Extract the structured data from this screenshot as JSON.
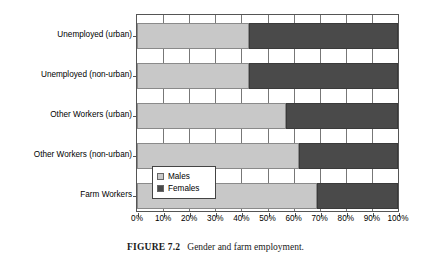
{
  "caption": {
    "label": "FIGURE 7.2",
    "text": "Gender and farm employment."
  },
  "legend": {
    "items": [
      {
        "label": "Males",
        "color": "#c8c8c8",
        "swatch_name": "legend-swatch-males"
      },
      {
        "label": "Females",
        "color": "#4a4a4a",
        "swatch_name": "legend-swatch-females"
      }
    ]
  },
  "chart_data": {
    "type": "bar",
    "orientation": "horizontal",
    "stacked": true,
    "stack_mode": "percent",
    "title": "",
    "xlabel": "",
    "ylabel": "",
    "xlim": [
      0,
      100
    ],
    "grid": true,
    "legend_position": "inside-left-lower",
    "categories": [
      "Unemployed (urban)",
      "Unemployed (non-urban)",
      "Other Workers (urban)",
      "Other Workers (non-urban)",
      "Farm Workers"
    ],
    "series": [
      {
        "name": "Males",
        "color": "#c8c8c8",
        "values": [
          43,
          43,
          57,
          62,
          69
        ]
      },
      {
        "name": "Females",
        "color": "#4a4a4a",
        "values": [
          57,
          57,
          43,
          38,
          31
        ]
      }
    ],
    "xticks": [
      0,
      10,
      20,
      30,
      40,
      50,
      60,
      70,
      80,
      90,
      100
    ],
    "xticklabels": [
      "0%",
      "10%",
      "20%",
      "30%",
      "40%",
      "50%",
      "60%",
      "70%",
      "80%",
      "90%",
      "100%"
    ]
  }
}
